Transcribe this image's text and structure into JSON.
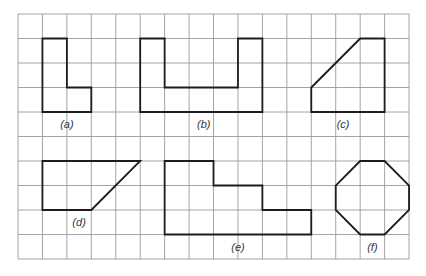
{
  "grid": {
    "origin_x": 18,
    "origin_y": 14,
    "cell_w": 24.44,
    "cell_h": 24.5,
    "cols": 16,
    "rows": 10,
    "line_color": "#9a9a9a",
    "shape_color": "#1c1c1c"
  },
  "shapes": [
    {
      "id": "a",
      "label": "(a)",
      "points": [
        [
          1,
          1
        ],
        [
          2,
          1
        ],
        [
          2,
          3
        ],
        [
          3,
          3
        ],
        [
          3,
          4
        ],
        [
          1,
          4
        ]
      ],
      "label_pos": [
        2,
        4.5
      ]
    },
    {
      "id": "b",
      "label": "(b)",
      "points": [
        [
          5,
          1
        ],
        [
          6,
          1
        ],
        [
          6,
          3
        ],
        [
          9,
          3
        ],
        [
          9,
          1
        ],
        [
          10,
          1
        ],
        [
          10,
          4
        ],
        [
          5,
          4
        ]
      ],
      "label_pos": [
        7.6,
        4.5
      ]
    },
    {
      "id": "c",
      "label": "(c)",
      "points": [
        [
          12,
          3
        ],
        [
          14,
          1
        ],
        [
          15,
          1
        ],
        [
          15,
          4
        ],
        [
          12,
          4
        ]
      ],
      "label_pos": [
        13.3,
        4.5
      ]
    },
    {
      "id": "d",
      "label": "(d)",
      "points": [
        [
          1,
          6
        ],
        [
          5,
          6
        ],
        [
          3,
          8
        ],
        [
          1,
          8
        ]
      ],
      "label_pos": [
        2.5,
        8.5
      ]
    },
    {
      "id": "e",
      "label": "(e)",
      "points": [
        [
          6,
          6
        ],
        [
          8,
          6
        ],
        [
          8,
          7
        ],
        [
          10,
          7
        ],
        [
          10,
          8
        ],
        [
          12,
          8
        ],
        [
          12,
          9
        ],
        [
          6,
          9
        ]
      ],
      "label_pos": [
        9,
        9.5
      ]
    },
    {
      "id": "f",
      "label": "(f)",
      "points": [
        [
          14,
          6
        ],
        [
          15,
          6
        ],
        [
          16,
          7
        ],
        [
          16,
          8
        ],
        [
          15,
          9
        ],
        [
          14,
          9
        ],
        [
          13,
          8
        ],
        [
          13,
          7
        ]
      ],
      "label_pos": [
        14.5,
        9.5
      ]
    }
  ]
}
